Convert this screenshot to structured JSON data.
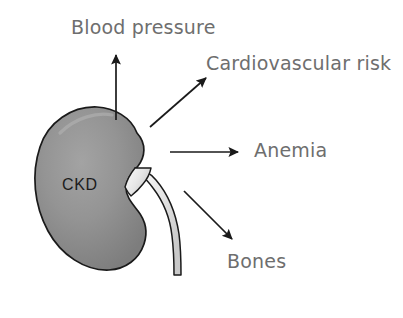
{
  "figure": {
    "kind": "medical-concept-diagram",
    "background_color": "#ffffff",
    "central_organ": {
      "name": "kidney",
      "label": "CKD",
      "label_color": "#1c1c1c",
      "fill_color": "#8d8d8d",
      "highlight_color": "#b4b4b4",
      "outline_color": "#1a1a1a",
      "ureter_fill_color": "#f0f0f0",
      "ureter_outline_color": "#1a1a1a"
    },
    "label_color": "#6e6e6e",
    "arrow_color": "#1a1a1a",
    "outcomes": [
      {
        "id": "blood-pressure",
        "label": "Blood pressure",
        "direction": "up",
        "arrow": "arrow-up"
      },
      {
        "id": "cardiovascular-risk",
        "label": "Cardiovascular risk",
        "direction": "up-right",
        "arrow": "arrow-up-right"
      },
      {
        "id": "anemia",
        "label": "Anemia",
        "direction": "right",
        "arrow": "arrow-right"
      },
      {
        "id": "bones",
        "label": "Bones",
        "direction": "down-right",
        "arrow": "arrow-down-right"
      }
    ]
  }
}
